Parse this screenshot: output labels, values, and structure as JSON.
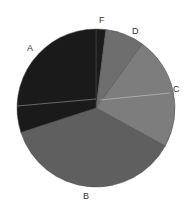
{
  "chart_data": {
    "type": "pie",
    "title": "",
    "categories": [
      "F",
      "D",
      "C",
      "B",
      "A"
    ],
    "values": [
      2,
      8,
      23,
      37,
      30
    ],
    "start_angle_deg": 0,
    "direction": "clockwise",
    "colors": [
      "#1c1c1c",
      "#6e6e6e",
      "#7d7d7d",
      "#5f5f5f",
      "#1a1a1a"
    ],
    "legend": "none",
    "labels_outside": true
  },
  "labels": {
    "F": "F",
    "D": "D",
    "C": "C",
    "B": "B",
    "A": "A"
  }
}
